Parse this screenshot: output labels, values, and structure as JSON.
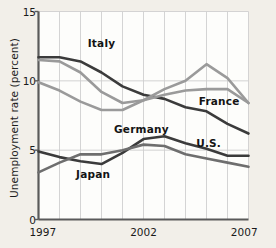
{
  "chart_data": {
    "type": "line",
    "title": "",
    "xlabel": "",
    "ylabel": "Unemployment rate (percent)",
    "x": [
      1997,
      1998,
      1999,
      2000,
      2001,
      2002,
      2003,
      2004,
      2005,
      2006,
      2007
    ],
    "xlim": [
      1997,
      2007
    ],
    "ylim": [
      0,
      15
    ],
    "yticks": [
      0,
      5,
      10,
      15
    ],
    "ytick_labels": [
      "0",
      "5",
      "10",
      "15"
    ],
    "xticks": [
      1997,
      2002,
      2007
    ],
    "xtick_labels": [
      "1997",
      "2002",
      "2007"
    ],
    "grid": "both",
    "legend": "inline-labels",
    "series": [
      {
        "name": "Italy",
        "color": "#3b3b3b",
        "label_x": 2000.0,
        "label_y": 12.75,
        "values": [
          11.7,
          11.7,
          11.4,
          10.6,
          9.6,
          9.0,
          8.7,
          8.1,
          7.8,
          6.9,
          6.2
        ]
      },
      {
        "name": "Germany",
        "color": "#9a9a9a",
        "label_x": 2001.9,
        "label_y": 6.55,
        "values": [
          9.9,
          9.3,
          8.5,
          7.9,
          7.9,
          8.6,
          9.4,
          10.0,
          11.2,
          10.2,
          8.4
        ]
      },
      {
        "name": "France",
        "color": "#9a9a9a",
        "label_x": 2005.6,
        "label_y": 8.55,
        "values": [
          11.5,
          11.4,
          10.6,
          9.2,
          8.4,
          8.6,
          9.0,
          9.3,
          9.4,
          9.4,
          8.4
        ]
      },
      {
        "name": "U.S.",
        "color": "#3b3b3b",
        "label_x": 2005.1,
        "label_y": 5.55,
        "values": [
          4.9,
          4.5,
          4.2,
          4.0,
          4.8,
          5.8,
          6.0,
          5.5,
          5.1,
          4.6,
          4.6
        ]
      },
      {
        "name": "Japan",
        "color": "#6e6e6e",
        "label_x": 1999.6,
        "label_y": 3.3,
        "values": [
          3.4,
          4.1,
          4.7,
          4.7,
          5.0,
          5.4,
          5.3,
          4.7,
          4.4,
          4.1,
          3.8
        ]
      }
    ],
    "colors": {
      "background": "#f2efe9",
      "plot_background": "#fdfdfb",
      "axis": "#5a5a5a",
      "grid": "#cfcfcf",
      "text": "#1a1a1a"
    }
  }
}
